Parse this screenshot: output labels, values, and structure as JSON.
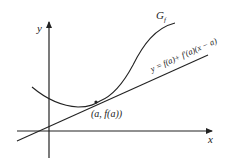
{
  "diagram": {
    "axes": {
      "x_label": "x",
      "y_label": "y"
    },
    "curve": {
      "label_main": "G",
      "label_sub": "f"
    },
    "tangent": {
      "equation": "y = f(a)+ f′(a)(x − a)"
    },
    "point": {
      "label": "(a, f(a))"
    },
    "colors": {
      "stroke": "#222222",
      "background": "#ffffff"
    }
  }
}
